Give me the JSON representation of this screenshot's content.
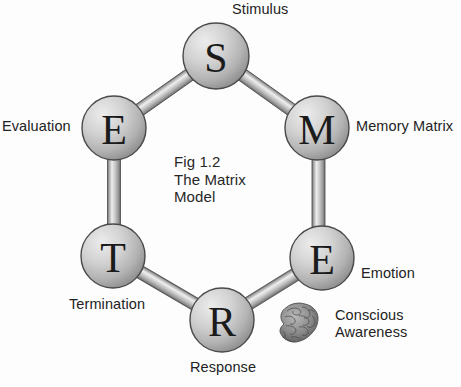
{
  "figure": {
    "caption": "Fig 1.2\nThe Matrix\nModel",
    "caption_lines": [
      "Fig 1.2",
      "The Matrix",
      "Model"
    ]
  },
  "colors": {
    "background": "#fdfdfd",
    "node_fill_light": "#e6e6e6",
    "node_fill_mid": "#c2c2c2",
    "node_fill_dark": "#8e8e8e",
    "node_stroke": "#4a4a4a",
    "rod_light": "#e9e9e9",
    "rod_mid": "#b4b4b4",
    "rod_dark": "#6f6f6f",
    "text": "#232323",
    "letter": "#1b1b1b",
    "brain": "#6d6d6d"
  },
  "nodes": [
    {
      "id": "stimulus",
      "letter": "S",
      "label": "Stimulus",
      "cx": 216,
      "cy": 56,
      "r": 33,
      "label_x": 232,
      "label_y": 2,
      "label_align": "left"
    },
    {
      "id": "memory-matrix",
      "letter": "M",
      "label": "Memory Matrix",
      "cx": 317,
      "cy": 128,
      "r": 32,
      "label_x": 356,
      "label_y": 119,
      "label_align": "left"
    },
    {
      "id": "emotion",
      "letter": "E",
      "label": "Emotion",
      "cx": 322,
      "cy": 258,
      "r": 32,
      "label_x": 361,
      "label_y": 265,
      "label_align": "left"
    },
    {
      "id": "response",
      "letter": "R",
      "label": "Response",
      "cx": 222,
      "cy": 320,
      "r": 32,
      "label_x": 190,
      "label_y": 360,
      "label_align": "left"
    },
    {
      "id": "termination",
      "letter": "T",
      "label": "Termination",
      "cx": 113,
      "cy": 256,
      "r": 32,
      "label_x": 70,
      "label_y": 297,
      "label_align": "left"
    },
    {
      "id": "evaluation",
      "letter": "E",
      "label": "Evaluation",
      "cx": 114,
      "cy": 128,
      "r": 32,
      "label_x": 2,
      "label_y": 118,
      "label_align": "left"
    }
  ],
  "connectors": [
    {
      "id": "evaluation-stimulus",
      "from": "evaluation",
      "to": "stimulus",
      "orientation": "diagonal"
    },
    {
      "id": "stimulus-memory",
      "from": "stimulus",
      "to": "memory-matrix",
      "orientation": "diagonal"
    },
    {
      "id": "memory-emotion",
      "from": "memory-matrix",
      "to": "emotion",
      "orientation": "vertical"
    },
    {
      "id": "emotion-response",
      "from": "emotion",
      "to": "response",
      "orientation": "diagonal"
    },
    {
      "id": "response-termination",
      "from": "response",
      "to": "termination",
      "orientation": "diagonal"
    },
    {
      "id": "termination-evaluation",
      "from": "termination",
      "to": "evaluation",
      "orientation": "vertical"
    }
  ],
  "annotation": {
    "id": "conscious-awareness",
    "icon": "brain-icon",
    "label_lines": [
      "Conscious",
      "Awareness"
    ],
    "label_x": 335,
    "label_y": 308,
    "icon_x": 277,
    "icon_y": 302,
    "icon_w": 42,
    "icon_h": 47
  },
  "figure_caption_position": {
    "x": 174,
    "y": 154
  }
}
